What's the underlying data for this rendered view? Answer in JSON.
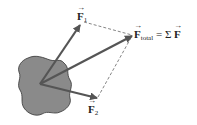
{
  "diagram": {
    "colors": {
      "object_fill": "#8a8a8a",
      "object_stroke": "#333333",
      "vector": "#555555",
      "dashed": "#666666",
      "background": "#ffffff"
    },
    "origin": [
      40,
      84
    ],
    "vectors": [
      {
        "name": "F1",
        "symbol": "F",
        "subscript": "1",
        "tip": [
          80,
          25
        ]
      },
      {
        "name": "F2",
        "symbol": "F",
        "subscript": "2",
        "tip": [
          97,
          98
        ]
      },
      {
        "name": "Ftotal",
        "symbol": "F",
        "subscript": "total",
        "tip": [
          132,
          36
        ]
      }
    ],
    "labels": {
      "f1_symbol": "F",
      "f1_sub": "1",
      "f2_symbol": "F",
      "f2_sub": "2",
      "ftotal_symbol": "F",
      "ftotal_sub": "total",
      "equals_sum": " = Σ ",
      "sum_symbol": "F"
    }
  }
}
